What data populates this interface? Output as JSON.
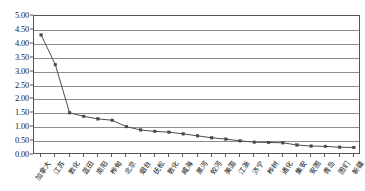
{
  "chart_data": {
    "type": "line",
    "title": "",
    "xlabel": "",
    "ylabel": "",
    "ylim": [
      0.0,
      5.0
    ],
    "ytick_step": 0.5,
    "grid": true,
    "legend": "none",
    "marker": "square",
    "line_color": "#4d4d4d",
    "grid_color": "#8c8c8c",
    "categories": [
      "加拿大",
      "江苏",
      "敦化",
      "蓝田",
      "南阳",
      "桦甸",
      "北京",
      "烟台",
      "抚松",
      "敦化",
      "威海",
      "黑河",
      "蛟河",
      "美国",
      "江浙",
      "济宁",
      "桦树",
      "通化",
      "集安",
      "安图",
      "青岛",
      "图们",
      "新疆"
    ],
    "ytick_labels": [
      "0.00",
      "0.50",
      "1.00",
      "1.50",
      "2.00",
      "2.50",
      "3.00",
      "3.50",
      "4.00",
      "4.50",
      "5.00"
    ],
    "values": [
      4.32,
      3.25,
      1.52,
      1.39,
      1.3,
      1.25,
      1.02,
      0.9,
      0.85,
      0.82,
      0.76,
      0.69,
      0.62,
      0.57,
      0.51,
      0.46,
      0.45,
      0.44,
      0.36,
      0.32,
      0.31,
      0.28,
      0.27
    ]
  }
}
